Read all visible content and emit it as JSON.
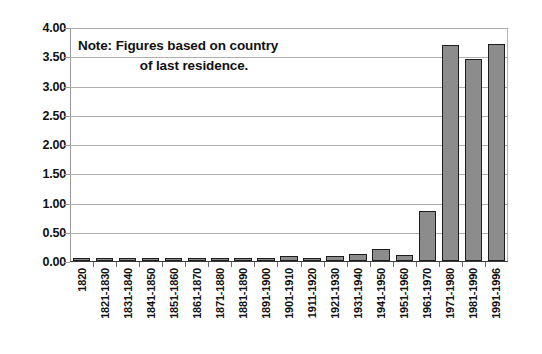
{
  "chart_data": {
    "type": "bar",
    "title": "",
    "xlabel": "",
    "ylabel": "",
    "ylim": [
      0,
      4.0
    ],
    "ytick_step": 0.5,
    "grid": true,
    "legend": null,
    "annotations": [
      {
        "name": "note",
        "line_1": "Note: Figures based on country",
        "line_2": "of last residence."
      }
    ],
    "ytick_labels": [
      "0.00",
      "0.50",
      "1.00",
      "1.50",
      "2.00",
      "2.50",
      "3.00",
      "3.50",
      "4.00"
    ],
    "ytick_values": [
      0.0,
      0.5,
      1.0,
      1.5,
      2.0,
      2.5,
      3.0,
      3.5,
      4.0
    ],
    "categories": [
      "1820",
      "1821-1830",
      "1831-1840",
      "1841-1850",
      "1851-1860",
      "1861-1870",
      "1871-1880",
      "1881-1890",
      "1891-1900",
      "1901-1910",
      "1911-1920",
      "1921-1930",
      "1931-1940",
      "1941-1950",
      "1951-1960",
      "1961-1970",
      "1971-1980",
      "1981-1990",
      "1991-1996"
    ],
    "values": [
      0.01,
      0.01,
      0.01,
      0.02,
      0.03,
      0.02,
      0.03,
      0.03,
      0.02,
      0.08,
      0.06,
      0.08,
      0.12,
      0.2,
      0.1,
      0.85,
      3.7,
      3.45,
      3.71
    ],
    "bar_color": "#8c8c8c",
    "bar_edge_color": "#1d1d1d",
    "grid_color": "#aeaeae",
    "axis_color": "#9a9a9a",
    "text_color": "#111111",
    "background_color": "#ffffff"
  }
}
